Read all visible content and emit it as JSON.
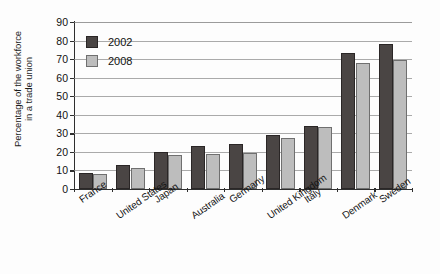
{
  "chart_data": {
    "type": "bar",
    "title": "",
    "xlabel": "",
    "ylabel": "Percentage of the workforce in a trade union",
    "ylabel_lines": [
      "Percentage of the workforce",
      "in a trade union"
    ],
    "categories": [
      "France",
      "United States",
      "Japan",
      "Australia",
      "Germany",
      "United Kingdom",
      "Italy",
      "Denmark",
      "Sweden"
    ],
    "series": [
      {
        "name": "2002",
        "color": "#4a4544",
        "values": [
          8.5,
          13,
          20,
          23,
          24,
          29,
          34,
          73.5,
          78
        ]
      },
      {
        "name": "2008",
        "color": "#bdbdbd",
        "values": [
          8,
          11.5,
          18.5,
          19,
          19.5,
          27.5,
          33.5,
          68,
          69.5
        ]
      }
    ],
    "ylim": [
      0,
      90
    ],
    "ytick_values": [
      0,
      10,
      20,
      30,
      40,
      50,
      60,
      70,
      80,
      90
    ],
    "ytick_labels": [
      "0",
      "10",
      "20",
      "30",
      "40",
      "50",
      "60",
      "70",
      "80",
      "90"
    ],
    "grid": true,
    "grid_axis": "y",
    "legend_position": "upper-left",
    "legend_entries": [
      "2002",
      "2008"
    ],
    "bar_orientation": "vertical",
    "xtick_label_rotation": -35
  }
}
